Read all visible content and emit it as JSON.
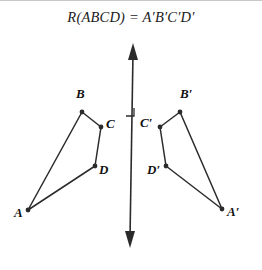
{
  "figure": {
    "title": "R(ABCD) = A′B′C′D′",
    "width": 262,
    "height": 270,
    "background_color": "#ffffff",
    "stroke_color": "#2b2b2b",
    "label_color": "#111111",
    "top_rule_color": "#c9c9c9"
  },
  "mirror_line": {
    "name": "reflection-axis",
    "x_top": 133,
    "y_top": 43,
    "x_bottom": 130,
    "y_bottom": 248,
    "arrow_top": true,
    "arrow_bottom": true
  },
  "right_angle_marker": {
    "name": "right-angle-marker",
    "x": 126,
    "y": 108,
    "size": 8
  },
  "connector": {
    "name": "segment-B-to-Bprime",
    "from": "B",
    "to": "B'",
    "y": 112
  },
  "shapes": [
    {
      "name": "quadrilateral-ABCD",
      "vertices": [
        {
          "label": "A",
          "x": 28,
          "y": 210,
          "label_dx": -14,
          "label_dy": 2
        },
        {
          "label": "B",
          "x": 82,
          "y": 112,
          "label_dx": -6,
          "label_dy": -19
        },
        {
          "label": "C",
          "x": 101,
          "y": 127,
          "label_dx": 5,
          "label_dy": -4
        },
        {
          "label": "D",
          "x": 95,
          "y": 166,
          "label_dx": 4,
          "label_dy": 3
        }
      ]
    },
    {
      "name": "quadrilateral-ApBpCpDp",
      "vertices": [
        {
          "label": "A′",
          "x": 222,
          "y": 209,
          "label_dx": 5,
          "label_dy": 2
        },
        {
          "label": "B′",
          "x": 180,
          "y": 112,
          "label_dx": 0,
          "label_dy": -19
        },
        {
          "label": "C′",
          "x": 160,
          "y": 127,
          "label_dx": -20,
          "label_dy": -5
        },
        {
          "label": "D′",
          "x": 166,
          "y": 166,
          "label_dx": -19,
          "label_dy": 3
        }
      ]
    }
  ]
}
